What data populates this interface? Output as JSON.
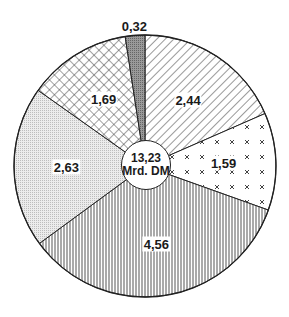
{
  "chart_data": {
    "type": "pie",
    "title": "",
    "total_label": "13,23",
    "total_unit": "Mrd. DM",
    "total": 13.23,
    "start_angle_deg": 0,
    "direction": "clockwise",
    "slices": [
      {
        "label": "2,44",
        "value": 2.44,
        "pattern": "diagonal-hatch"
      },
      {
        "label": "1,59",
        "value": 1.59,
        "pattern": "cross-dots"
      },
      {
        "label": "4,56",
        "value": 4.56,
        "pattern": "vertical-lines"
      },
      {
        "label": "2,63",
        "value": 2.63,
        "pattern": "light-stipple"
      },
      {
        "label": "1,69",
        "value": 1.69,
        "pattern": "crosshatch"
      },
      {
        "label": "0,32",
        "value": 0.32,
        "pattern": "dark-stipple"
      }
    ],
    "colors": {
      "line": "#222222",
      "background": "#ffffff",
      "stipple_light": "#d9d9d9",
      "stipple_dark": "#8c8c8c"
    }
  }
}
